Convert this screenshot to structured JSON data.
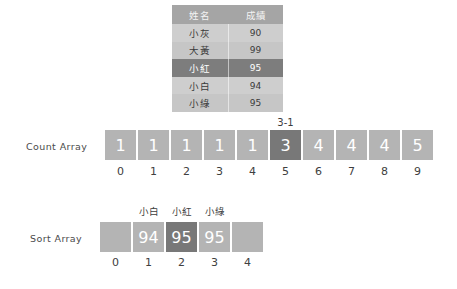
{
  "score_table": {
    "headers": [
      "姓名",
      "成績"
    ],
    "rows": [
      {
        "name": "小灰",
        "score": "90",
        "highlighted": false
      },
      {
        "name": "大黃",
        "score": "99",
        "highlighted": false
      },
      {
        "name": "小紅",
        "score": "95",
        "highlighted": true
      },
      {
        "name": "小白",
        "score": "94",
        "highlighted": false
      },
      {
        "name": "小綠",
        "score": "95",
        "highlighted": false
      }
    ]
  },
  "count_array": {
    "label": "Count Array",
    "values": [
      "1",
      "1",
      "1",
      "1",
      "1",
      "3",
      "4",
      "4",
      "4",
      "5"
    ],
    "indices": [
      "0",
      "1",
      "2",
      "3",
      "4",
      "5",
      "6",
      "7",
      "8",
      "9"
    ],
    "highlight_index": 5,
    "annotation": "3-1",
    "annotation_index": 5
  },
  "sort_array": {
    "label": "Sort Array",
    "values": [
      "",
      "94",
      "95",
      "95",
      ""
    ],
    "top_labels": [
      "",
      "小白",
      "小紅",
      "小綠",
      ""
    ],
    "indices": [
      "0",
      "1",
      "2",
      "3",
      "4"
    ],
    "highlight_index": 2
  },
  "colors": {
    "cell_normal": "#b4b4b4",
    "cell_highlight": "#787878",
    "table_header": "#a5a5a5",
    "table_row": "#cecece",
    "table_row_active": "#7d7d7d",
    "background": "#ffffff",
    "text_dark": "#3a3a3a",
    "text_light": "#ffffff"
  }
}
